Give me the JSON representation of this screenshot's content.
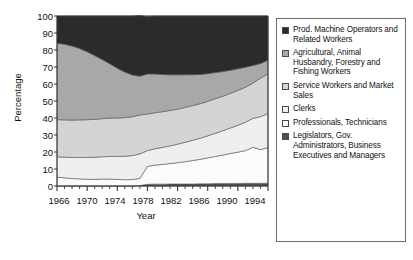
{
  "chart_data": {
    "type": "area",
    "stacked": true,
    "title": "",
    "xlabel": "Year",
    "ylabel": "Percentage",
    "xlim": [
      1966,
      1994
    ],
    "ylim": [
      0,
      100
    ],
    "grid": false,
    "legend_position": "right",
    "x": [
      1966,
      1967,
      1968,
      1969,
      1970,
      1971,
      1972,
      1973,
      1974,
      1975,
      1976,
      1977,
      1978,
      1979,
      1980,
      1981,
      1982,
      1983,
      1984,
      1985,
      1986,
      1987,
      1988,
      1989,
      1990,
      1991,
      1992,
      1993,
      1994
    ],
    "x_tick_labels": [
      "1966",
      "1970",
      "1974",
      "1978",
      "1982",
      "1986",
      "1990",
      "1994"
    ],
    "x_tick_values": [
      1966,
      1970,
      1974,
      1978,
      1982,
      1986,
      1990,
      1994
    ],
    "y_tick_labels": [
      "0",
      "10",
      "20",
      "30",
      "40",
      "50",
      "60",
      "70",
      "80",
      "90",
      "100"
    ],
    "y_tick_values": [
      0,
      10,
      20,
      30,
      40,
      50,
      60,
      70,
      80,
      90,
      100
    ],
    "series": [
      {
        "name": "Legislators, Gov. Administrators, Business Executives and Managers",
        "color": "#4f4f4f",
        "values": [
          0,
          0,
          0,
          0,
          0,
          0,
          0,
          0,
          0,
          0,
          0,
          0.3,
          1.0,
          1.1,
          1.1,
          1.2,
          1.2,
          1.2,
          1.2,
          1.3,
          1.3,
          1.4,
          1.4,
          1.5,
          1.5,
          1.6,
          1.6,
          1.6,
          1.6
        ]
      },
      {
        "name": "Professionals, Technicians",
        "color": "#fbfbfb",
        "values": [
          5.2,
          4.8,
          4.4,
          4.2,
          4.0,
          3.9,
          4.1,
          4.1,
          3.9,
          3.7,
          3.8,
          4.2,
          10.5,
          11.2,
          11.6,
          12.0,
          12.5,
          13.1,
          13.8,
          14.4,
          15.2,
          16.0,
          16.8,
          17.6,
          18.4,
          19.2,
          21.2,
          19.8,
          21.0
        ]
      },
      {
        "name": "Clerks",
        "color": "#efefef",
        "values": [
          12.0,
          12.2,
          12.4,
          12.6,
          12.8,
          13.0,
          13.1,
          13.3,
          13.5,
          13.8,
          14.1,
          14.4,
          9.3,
          9.6,
          10.0,
          10.4,
          10.9,
          11.4,
          11.9,
          12.4,
          13.0,
          13.6,
          14.3,
          15.0,
          15.8,
          16.7,
          17.0,
          19.4,
          20.0
        ]
      },
      {
        "name": "Service Workers and Market Sales",
        "color": "#d4d4d4",
        "values": [
          21.8,
          21.9,
          22.0,
          22.1,
          22.2,
          22.3,
          22.4,
          22.5,
          22.6,
          22.7,
          22.8,
          22.9,
          21.5,
          21.2,
          21.0,
          20.8,
          20.6,
          20.5,
          20.4,
          20.3,
          20.3,
          20.3,
          20.3,
          20.4,
          20.5,
          20.6,
          20.7,
          22.6,
          23.4
        ]
      },
      {
        "name": "Agricultural, Animal Husbandry, Forestry and Fishing Workers",
        "color": "#a8a8a8",
        "values": [
          45.0,
          44.5,
          43.5,
          42.0,
          40.0,
          37.5,
          34.8,
          32.0,
          29.3,
          26.8,
          24.6,
          22.8,
          23.6,
          22.8,
          21.9,
          21.0,
          20.2,
          19.2,
          18.2,
          17.2,
          16.3,
          15.4,
          14.5,
          13.6,
          12.7,
          11.8,
          10.4,
          8.6,
          8.0
        ]
      },
      {
        "name": "Prod. Machine Operators and Related Workers",
        "color": "#2b2b2b",
        "values": [
          16.0,
          16.6,
          17.7,
          19.1,
          21.0,
          23.3,
          25.6,
          28.1,
          30.7,
          33.0,
          34.7,
          35.7,
          33.8,
          34.1,
          34.4,
          34.6,
          34.6,
          34.6,
          34.5,
          34.4,
          33.9,
          33.3,
          32.7,
          31.9,
          31.1,
          30.1,
          29.1,
          28.0,
          26.0
        ]
      }
    ],
    "cumulative_upper_boundaries": {
      "professionals_top": [
        5.2,
        4.8,
        4.4,
        4.2,
        4.0,
        3.9,
        4.1,
        4.1,
        3.9,
        3.7,
        3.8,
        4.5,
        11.5,
        12.3,
        12.7,
        13.2,
        13.7,
        14.3,
        15.0,
        15.7,
        16.5,
        17.4,
        18.2,
        19.1,
        19.9,
        20.8,
        22.8,
        21.4,
        22.6
      ],
      "clerks_top": [
        17.2,
        17.0,
        16.8,
        16.8,
        16.8,
        16.9,
        17.2,
        17.4,
        17.4,
        17.5,
        17.9,
        18.9,
        20.8,
        21.9,
        22.7,
        23.6,
        24.6,
        25.7,
        26.9,
        28.1,
        29.5,
        31.0,
        32.5,
        34.1,
        35.7,
        37.5,
        39.8,
        40.8,
        42.6
      ],
      "service_top": [
        39.0,
        38.9,
        38.8,
        38.9,
        39.0,
        39.2,
        39.6,
        39.9,
        40.0,
        40.2,
        40.7,
        41.8,
        42.3,
        43.1,
        43.7,
        44.4,
        45.2,
        46.2,
        47.3,
        48.4,
        49.8,
        51.3,
        52.8,
        54.5,
        56.2,
        58.1,
        60.5,
        63.4,
        66.0
      ],
      "agriculture_top": [
        84.0,
        83.4,
        82.3,
        80.9,
        79.0,
        76.7,
        74.4,
        71.9,
        69.3,
        67.0,
        65.3,
        64.6,
        65.9,
        65.9,
        65.6,
        65.4,
        65.4,
        65.4,
        65.5,
        65.6,
        66.1,
        66.7,
        67.3,
        68.1,
        68.9,
        69.9,
        70.9,
        72.0,
        74.0
      ],
      "total_top": [
        100,
        100,
        100,
        100,
        100,
        100,
        100,
        100,
        100,
        100,
        100,
        100,
        100,
        100,
        100,
        100,
        100,
        100,
        100,
        100,
        100,
        100,
        100,
        100,
        100,
        100,
        100,
        100,
        100
      ]
    }
  },
  "axis": {
    "ylabel": "Percentage",
    "xlabel": "Year",
    "yticks": [
      "100",
      "90",
      "80",
      "70",
      "60",
      "50",
      "40",
      "30",
      "20",
      "10",
      "0"
    ],
    "xticks": [
      "1966",
      "1970",
      "1974",
      "1978",
      "1982",
      "1986",
      "1990",
      "1994"
    ]
  },
  "legend": {
    "entries": [
      {
        "label": "Prod. Machine Operators and Related Workers",
        "color": "#2b2b2b"
      },
      {
        "label": "Agricultural, Animal Husbandry, Forestry and Fishing Workers",
        "color": "#a8a8a8"
      },
      {
        "label": "Service Workers and Market Sales",
        "color": "#d4d4d4"
      },
      {
        "label": "Clerks",
        "color": "#efefef"
      },
      {
        "label": "Professionals, Technicians",
        "color": "#fbfbfb"
      },
      {
        "label": "Legislators, Gov. Administrators, Business Executives and Managers",
        "color": "#4f4f4f"
      }
    ]
  }
}
